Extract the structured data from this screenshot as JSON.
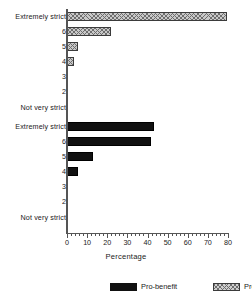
{
  "chart_data": {
    "type": "bar",
    "orientation": "horizontal",
    "title": "",
    "xlabel": "Percentage",
    "ylabel": "",
    "xlim": [
      0,
      80
    ],
    "xticks": [
      0,
      10,
      20,
      30,
      40,
      50,
      60,
      70,
      80
    ],
    "xtick_labels": [
      "0",
      "10",
      "20",
      "30",
      "40",
      "50",
      "60",
      "70",
      "80"
    ],
    "minor_tick_step": 2,
    "grid": false,
    "legend_position": "bottom",
    "categories": [
      "Extremely strict",
      "6",
      "5",
      "4",
      "3",
      "2",
      "Not very strict"
    ],
    "panels": [
      {
        "name": "pro-support-panel",
        "series_name": "Pro-support",
        "fill": "hatched",
        "values": [
          79.5,
          22.0,
          5.5,
          3.5,
          0,
          0,
          0
        ]
      },
      {
        "name": "pro-benefit-panel",
        "series_name": "Pro-benefit",
        "fill": "solid",
        "values": [
          43.0,
          41.5,
          13.0,
          5.5,
          0,
          0,
          0
        ]
      }
    ],
    "series": [
      {
        "name": "Pro-support",
        "values": [
          79.5,
          22.0,
          5.5,
          3.5,
          0,
          0,
          0
        ]
      },
      {
        "name": "Pro-benefit",
        "values": [
          43.0,
          41.5,
          13.0,
          5.5,
          0,
          0,
          0
        ]
      }
    ]
  },
  "legend": {
    "items": [
      {
        "label": "Pro-benefit",
        "fill": "solid",
        "color": "#111111"
      },
      {
        "label": "Pro-su",
        "fill": "hatched",
        "color": "#c9c9c9"
      }
    ]
  },
  "colors": {
    "solid": "#111111",
    "hatch_bg": "#c9c9c9",
    "hatch_line": "#6e6e6e",
    "axis": "#555555",
    "text": "#1a1a1a"
  }
}
